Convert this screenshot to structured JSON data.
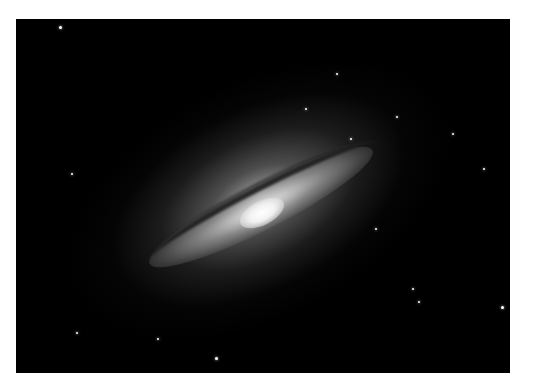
{
  "image": {
    "subject": "edge-on spiral galaxy with dark dust lane",
    "palette": {
      "background": "#000000",
      "core": "#ffffff",
      "halo": "#9a9a9a",
      "dust": "#1a1a1a",
      "page": "#ffffff"
    },
    "stars": [
      {
        "x": 44,
        "y": 8,
        "r": 1.5
      },
      {
        "x": 321,
        "y": 55,
        "r": 1
      },
      {
        "x": 381,
        "y": 98,
        "r": 1
      },
      {
        "x": 437,
        "y": 115,
        "r": 1.2
      },
      {
        "x": 56,
        "y": 155,
        "r": 1
      },
      {
        "x": 468,
        "y": 150,
        "r": 1
      },
      {
        "x": 397,
        "y": 270,
        "r": 1.2
      },
      {
        "x": 486,
        "y": 288,
        "r": 1.5
      },
      {
        "x": 403,
        "y": 283,
        "r": 1
      },
      {
        "x": 200,
        "y": 339,
        "r": 1.5
      },
      {
        "x": 61,
        "y": 314,
        "r": 1
      },
      {
        "x": 142,
        "y": 320,
        "r": 1
      },
      {
        "x": 290,
        "y": 90,
        "r": 1
      },
      {
        "x": 360,
        "y": 210,
        "r": 1
      },
      {
        "x": 335,
        "y": 120,
        "r": 1
      }
    ]
  }
}
